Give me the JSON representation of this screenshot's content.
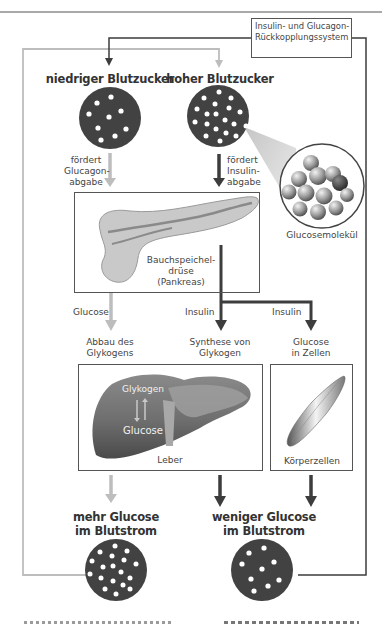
{
  "feedback_box": {
    "line1": "Insulin- und Glucagon-",
    "line2": "Rückkopplungssystem"
  },
  "states": {
    "low": "niedriger Blutzucker",
    "high": "hoher Blutzucker",
    "more_glucose_line1": "mehr Glucose",
    "more_glucose_line2": "im Blutstrom",
    "less_glucose_line1": "weniger Glucose",
    "less_glucose_line2": "im Blutstrom"
  },
  "arrows": {
    "glucagon_line1": "fördert",
    "glucagon_line2": "Glucagon-",
    "glucagon_line3": "abgabe",
    "insulin_line1": "fördert",
    "insulin_line2": "Insulin-",
    "insulin_line3": "abgabe",
    "glucose": "Glucose",
    "insulin_a": "Insulin",
    "insulin_b": "Insulin"
  },
  "processes": {
    "breakdown_line1": "Abbau des",
    "breakdown_line2": "Glykogens",
    "synthesis_line1": "Synthese von",
    "synthesis_line2": "Glykogen",
    "uptake_line1": "Glucose",
    "uptake_line2": "in Zellen"
  },
  "organs": {
    "pancreas_line1": "Bauchspeichel-",
    "pancreas_line2": "drüse",
    "pancreas_line3": "(Pankreas)",
    "liver": "Leber",
    "liver_glycogen": "Glykogen",
    "liver_glucose": "Glucose",
    "body_cells": "Körperzellen",
    "molecule": "Glucosemolekül"
  },
  "colors": {
    "dark": "#3d3d3d",
    "light": "#bdbdbd",
    "circle": "#424242",
    "frame": "#555555"
  }
}
